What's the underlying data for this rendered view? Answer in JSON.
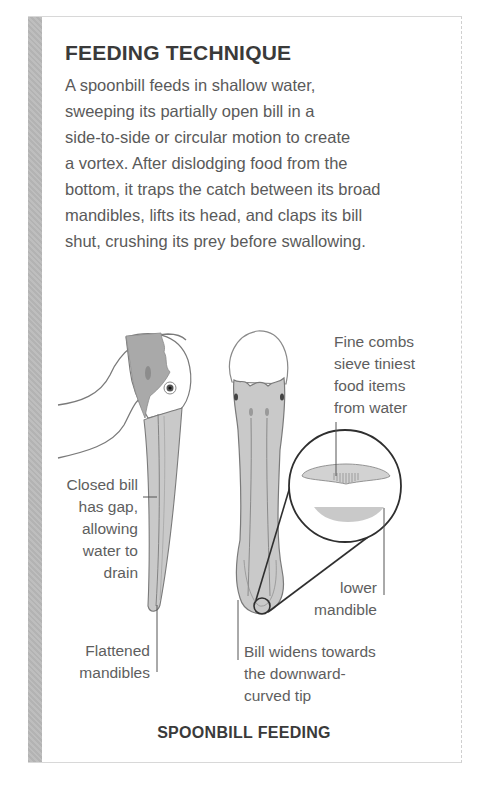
{
  "panel": {
    "title": "FEEDING TECHNIQUE",
    "body_lines": [
      "A spoonbill feeds in shallow water,",
      "sweeping its partially open bill in a",
      "side-to-side or circular motion to create",
      "a vortex. After dislodging food from the",
      "bottom, it traps the catch between its broad",
      "mandibles, lifts its head, and claps its bill",
      "shut, crushing its prey before swallowing."
    ],
    "caption": "SPOONBILL FEEDING",
    "side_bar_color": "#b8b8b8"
  },
  "diagram": {
    "illustrations": [
      "spoonbill-head-side-view",
      "spoonbill-head-top-view",
      "bill-cross-section-magnifier"
    ],
    "annotations": {
      "closed_bill": [
        "Closed bill",
        "has gap,",
        "allowing",
        "water to",
        "drain"
      ],
      "flattened": [
        "Flattened",
        "mandibles"
      ],
      "fine_combs": [
        "Fine combs",
        "sieve tiniest",
        "food items",
        "from water"
      ],
      "lower_mandible": [
        "lower",
        "mandible"
      ],
      "bill_widens": [
        "Bill widens towards",
        "the downward-",
        "curved tip"
      ]
    },
    "colors": {
      "bill_fill": "#c9c9c9",
      "head_dark": "#a9a9a9",
      "outline": "#6a6a6a",
      "magnifier": "#2f2f2f"
    }
  }
}
